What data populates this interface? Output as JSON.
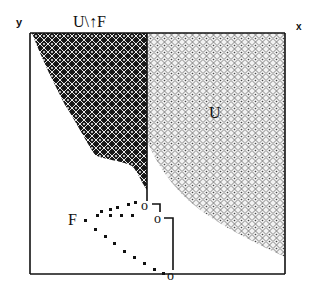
{
  "diagram": {
    "axis_labels": {
      "y": "y",
      "x": "x"
    },
    "region_labels": {
      "top": "U\\↑F",
      "right": "U",
      "points": "F"
    },
    "nodes": [
      "o",
      "o",
      "o"
    ],
    "colors": {
      "frame": "#111111",
      "dark_region": "#1a1a1a",
      "light_region": "#8a8a8a",
      "background": "#ffffff"
    }
  }
}
